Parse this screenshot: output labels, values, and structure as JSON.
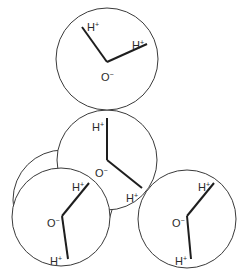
{
  "diagram": {
    "stroke_color": "#1e1e1e",
    "circle_color": "#3a3a3a",
    "molecules": [
      {
        "id": "back",
        "circle": {
          "cx": 63,
          "cy": 200,
          "r": 50
        },
        "hidden_contents": true
      },
      {
        "id": "middle",
        "circle": {
          "cx": 107,
          "cy": 160,
          "r": 50
        },
        "oxygen": {
          "label": "O",
          "charge": "−",
          "x": 95,
          "y": 177
        },
        "hydrogens": [
          {
            "label": "H",
            "charge": "+",
            "x": 92,
            "y": 131
          },
          {
            "label": "H",
            "charge": "+",
            "x": 126,
            "y": 202
          }
        ]
      },
      {
        "id": "top",
        "circle": {
          "cx": 107,
          "cy": 59,
          "r": 51
        },
        "oxygen": {
          "label": "O",
          "charge": "−",
          "x": 101,
          "y": 81
        },
        "hydrogens": [
          {
            "label": "H",
            "charge": "+",
            "x": 87,
            "y": 31
          },
          {
            "label": "H",
            "charge": "+",
            "x": 132,
            "y": 49
          }
        ]
      },
      {
        "id": "bottom-right",
        "circle": {
          "cx": 187,
          "cy": 219,
          "r": 49
        },
        "oxygen": {
          "label": "O",
          "charge": "−",
          "x": 172,
          "y": 227
        },
        "hydrogens": [
          {
            "label": "H",
            "charge": "+",
            "x": 198,
            "y": 191
          },
          {
            "label": "H",
            "charge": "+",
            "x": 175,
            "y": 265
          }
        ]
      },
      {
        "id": "bottom-left",
        "circle": {
          "cx": 61,
          "cy": 217,
          "r": 49
        },
        "oxygen": {
          "label": "O",
          "charge": "−",
          "x": 47,
          "y": 227
        },
        "hydrogens": [
          {
            "label": "H",
            "charge": "+",
            "x": 72,
            "y": 191
          },
          {
            "label": "H",
            "charge": "+",
            "x": 50,
            "y": 265
          }
        ]
      }
    ]
  },
  "labels": {
    "h": "H",
    "h_charge": "+",
    "o": "O",
    "o_charge": "−"
  }
}
